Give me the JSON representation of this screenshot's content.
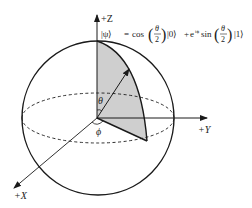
{
  "diagram": {
    "axes": {
      "z_label": "+Z",
      "y_label": "+Y",
      "x_label": "+X"
    },
    "angles": {
      "theta": "θ",
      "phi": "ϕ"
    },
    "formula": {
      "lhs": "|ψ⟩",
      "eq": "=",
      "cos": "cos",
      "theta": "θ",
      "two": "2",
      "ket0": "|0⟩",
      "plus": "+",
      "exp": "e",
      "exp_sup": "iϕ",
      "sin": "sin",
      "ket1": "|1⟩"
    },
    "colors": {
      "stroke": "#1a1a1a",
      "shade": "#cfcfcf",
      "background": "#ffffff"
    }
  }
}
